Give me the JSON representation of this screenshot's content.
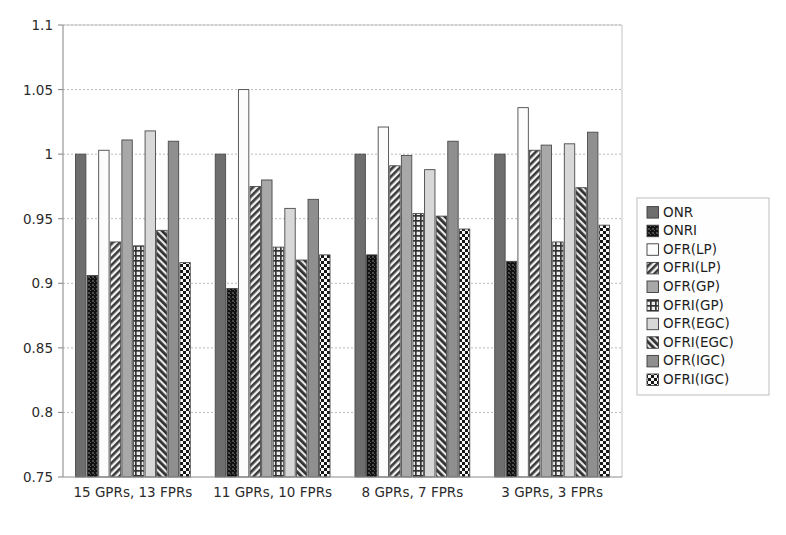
{
  "chart_data": {
    "type": "bar",
    "title": "",
    "subtitle": "",
    "xlabel": "",
    "ylabel": "",
    "ylim": [
      0.75,
      1.1
    ],
    "ytick_labels": [
      "1.1",
      "1.05",
      "1",
      "0.95",
      "0.9",
      "0.85",
      "0.8",
      "0.75"
    ],
    "ytick_values": [
      1.1,
      1.05,
      1.0,
      0.95,
      0.9,
      0.85,
      0.8,
      0.75
    ],
    "grid": true,
    "grid_axis": "y",
    "legend_position": "right-outside",
    "categories": [
      "15 GPRs, 13 FPRs",
      "11 GPRs, 10 FPRs",
      "8 GPRs, 7 FPRs",
      "3 GPRs, 3 FPRs"
    ],
    "series": [
      {
        "name": "ONR",
        "pattern": "solid-dark-gray",
        "color": "#6e6e6e",
        "values": [
          1.0,
          1.0,
          1.0,
          1.0
        ]
      },
      {
        "name": "ONRI",
        "pattern": "dense-dots-black",
        "color": "#1a1a1a",
        "values": [
          0.906,
          0.896,
          0.922,
          0.917
        ]
      },
      {
        "name": "OFR(LP)",
        "pattern": "white-empty",
        "color": "#fbfbfb",
        "values": [
          1.003,
          1.05,
          1.021,
          1.036
        ]
      },
      {
        "name": "OFRI(LP)",
        "pattern": "diagonal-hatch",
        "color": "#8a8a8a",
        "values": [
          0.932,
          0.975,
          0.991,
          1.003
        ]
      },
      {
        "name": "OFR(GP)",
        "pattern": "solid-mid-gray",
        "color": "#a8a8a8",
        "values": [
          1.011,
          0.98,
          0.999,
          1.007
        ]
      },
      {
        "name": "OFRI(GP)",
        "pattern": "grid-crosshatch",
        "color": "#909090",
        "values": [
          0.929,
          0.928,
          0.954,
          0.932
        ]
      },
      {
        "name": "OFR(EGC)",
        "pattern": "solid-light-gray",
        "color": "#d8d8d8",
        "values": [
          1.018,
          0.958,
          0.988,
          1.008
        ]
      },
      {
        "name": "OFRI(EGC)",
        "pattern": "back-diagonal-dense",
        "color": "#5e5e5e",
        "values": [
          0.941,
          0.918,
          0.952,
          0.974
        ]
      },
      {
        "name": "OFR(IGC)",
        "pattern": "solid-gray",
        "color": "#8f8f8f",
        "values": [
          1.01,
          0.965,
          1.01,
          1.017
        ]
      },
      {
        "name": "OFRI(IGC)",
        "pattern": "checkerboard",
        "color": "#2f2f2f",
        "values": [
          0.916,
          0.922,
          0.942,
          0.945
        ]
      }
    ]
  },
  "legend": {
    "entries": [
      "ONR",
      "ONRI",
      "OFR(LP)",
      "OFRI(LP)",
      "OFR(GP)",
      "OFRI(GP)",
      "OFR(EGC)",
      "OFRI(EGC)",
      "OFR(IGC)",
      "OFRI(IGC)"
    ]
  },
  "colors": {
    "background": "#ffffff",
    "grid": "#b9b9b9",
    "axis": "#8d8d8d",
    "text": "#2b2b2b",
    "bar_outline": "#4a4a4a"
  }
}
